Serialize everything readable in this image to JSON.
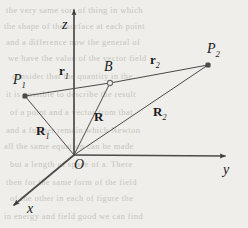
{
  "figure": {
    "type": "vector-diagram",
    "canvas": {
      "width": 248,
      "height": 228
    },
    "background_color": "#efeeea",
    "stroke_color": "#4a4a4a",
    "label_color": "#1a1a1a",
    "axes": [
      {
        "name": "z",
        "label": "z",
        "from": [
          74,
          155
        ],
        "to": [
          74,
          10
        ],
        "label_pos": [
          62,
          18
        ],
        "arrow": true
      },
      {
        "name": "y",
        "label": "y",
        "from": [
          74,
          155
        ],
        "to": [
          225,
          156
        ],
        "label_pos": [
          223,
          163
        ],
        "arrow": true
      },
      {
        "name": "x",
        "label": "x",
        "from": [
          74,
          155
        ],
        "to": [
          14,
          205
        ],
        "label_pos": [
          27,
          202
        ],
        "arrow": true
      }
    ],
    "points": [
      {
        "name": "P1",
        "label": "P",
        "sub": "1",
        "pos": [
          25,
          96
        ],
        "marker": "filled-dot",
        "label_pos": [
          13,
          73
        ]
      },
      {
        "name": "B",
        "label": "B",
        "sub": "",
        "pos": [
          110,
          83
        ],
        "marker": "open-dot",
        "label_pos": [
          104,
          60
        ]
      },
      {
        "name": "P2",
        "label": "P",
        "sub": "2",
        "pos": [
          208,
          65
        ],
        "marker": "filled-dot",
        "label_pos": [
          207,
          42
        ]
      }
    ],
    "vectors": [
      {
        "name": "R1",
        "label": "R",
        "sub": "1",
        "from": [
          74,
          155
        ],
        "to": [
          25,
          96
        ],
        "label_pos": [
          36,
          124
        ]
      },
      {
        "name": "R",
        "label": "R",
        "sub": "",
        "from": [
          74,
          155
        ],
        "to": [
          110,
          83
        ],
        "label_pos": [
          94,
          110
        ]
      },
      {
        "name": "R2",
        "label": "R",
        "sub": "2",
        "from": [
          74,
          155
        ],
        "to": [
          208,
          65
        ],
        "label_pos": [
          153,
          105
        ]
      },
      {
        "name": "r1",
        "label": "r",
        "sub": "1",
        "from": [
          25,
          96
        ],
        "to": [
          110,
          83
        ],
        "label_pos": [
          59,
          64
        ]
      },
      {
        "name": "r2",
        "label": "r",
        "sub": "2",
        "from": [
          110,
          83
        ],
        "to": [
          208,
          65
        ],
        "label_pos": [
          150,
          53
        ]
      }
    ],
    "bleed_through_lines": [
      {
        "text": "the very same sort of thing in which",
        "pos": [
          6,
          5
        ]
      },
      {
        "text": "the shape of the surface at each point",
        "pos": [
          4,
          21
        ]
      },
      {
        "text": "and a difference now the general of",
        "pos": [
          6,
          37
        ]
      },
      {
        "text": "we have the value of the vector field",
        "pos": [
          8,
          53
        ]
      },
      {
        "text": "consider that the quantity in the",
        "pos": [
          12,
          71
        ]
      },
      {
        "text": "it is possible to describe the result",
        "pos": [
          6,
          89
        ]
      },
      {
        "text": "of a point and a vector from that",
        "pos": [
          10,
          107
        ]
      },
      {
        "text": "and a further remain which Newton",
        "pos": [
          6,
          125
        ]
      },
      {
        "text": "all the same equation can be made",
        "pos": [
          4,
          141
        ]
      },
      {
        "text": "but a length of space of a. There",
        "pos": [
          10,
          159
        ]
      },
      {
        "text": "then for the same form of the field",
        "pos": [
          6,
          177
        ]
      },
      {
        "text": "of the other in each of figure the",
        "pos": [
          10,
          193
        ]
      },
      {
        "text": "in energy and field good we can find",
        "pos": [
          4,
          211
        ]
      }
    ]
  }
}
